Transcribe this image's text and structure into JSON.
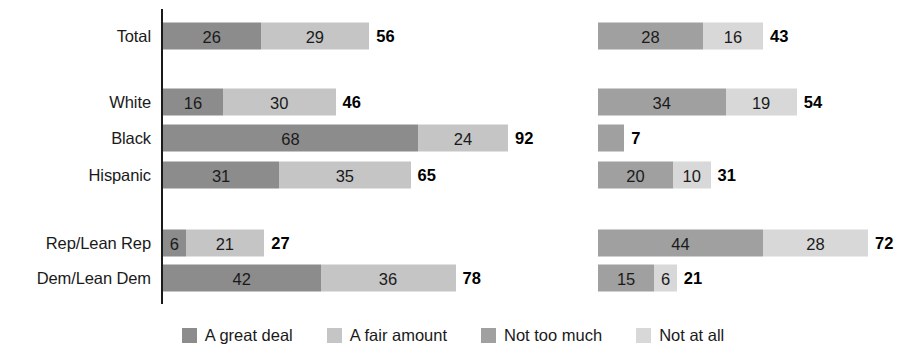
{
  "chart_data": {
    "type": "bar",
    "subtype": "stacked-horizontal-two-panel",
    "title": "",
    "xlabel": "",
    "ylabel": "",
    "grid": false,
    "axis_line": true,
    "units": "percent",
    "scale_px_per_unit": 3.75,
    "categories": [
      "Total",
      "White",
      "Black",
      "Hispanic",
      "Rep/Lean Rep",
      "Dem/Lean Dem"
    ],
    "legend": {
      "position": "bottom-center",
      "entries": [
        {
          "label": "A great deal",
          "color": "#8c8c8c"
        },
        {
          "label": "A fair amount",
          "color": "#c5c5c5"
        },
        {
          "label": "Not too much",
          "color": "#a0a0a0"
        },
        {
          "label": "Not at all",
          "color": "#d8d8d8"
        }
      ]
    },
    "panels": [
      {
        "name": "left",
        "series": [
          {
            "name": "A great deal",
            "color": "#8c8c8c",
            "values": [
              26,
              16,
              68,
              31,
              6,
              42
            ]
          },
          {
            "name": "A fair amount",
            "color": "#c5c5c5",
            "values": [
              29,
              30,
              24,
              35,
              21,
              36
            ]
          }
        ],
        "totals": [
          56,
          46,
          92,
          65,
          27,
          78
        ]
      },
      {
        "name": "right",
        "series": [
          {
            "name": "Not too much",
            "color": "#a0a0a0",
            "values": [
              28,
              34,
              7,
              20,
              44,
              15
            ]
          },
          {
            "name": "Not at all",
            "color": "#d8d8d8",
            "values": [
              16,
              19,
              0,
              10,
              28,
              6
            ]
          }
        ],
        "totals": [
          43,
          54,
          7,
          31,
          72,
          21
        ]
      }
    ]
  },
  "rows": [
    {
      "label": "Total",
      "y": 36,
      "left": {
        "seg1": "26",
        "seg1_v": 26,
        "seg2": "29",
        "seg2_v": 29,
        "total": "56"
      },
      "right": {
        "seg1": "28",
        "seg1_v": 28,
        "seg2": "16",
        "seg2_v": 16,
        "total": "43"
      }
    },
    {
      "label": "White",
      "y": 102,
      "left": {
        "seg1": "16",
        "seg1_v": 16,
        "seg2": "30",
        "seg2_v": 30,
        "total": "46"
      },
      "right": {
        "seg1": "34",
        "seg1_v": 34,
        "seg2": "19",
        "seg2_v": 19,
        "total": "54"
      }
    },
    {
      "label": "Black",
      "y": 138,
      "left": {
        "seg1": "68",
        "seg1_v": 68,
        "seg2": "24",
        "seg2_v": 24,
        "total": "92"
      },
      "right": {
        "seg1": "",
        "seg1_v": 7,
        "seg2": "",
        "seg2_v": 0,
        "total": "7"
      }
    },
    {
      "label": "Hispanic",
      "y": 175,
      "left": {
        "seg1": "31",
        "seg1_v": 31,
        "seg2": "35",
        "seg2_v": 35,
        "total": "65"
      },
      "right": {
        "seg1": "20",
        "seg1_v": 20,
        "seg2": "10",
        "seg2_v": 10,
        "total": "31"
      }
    },
    {
      "label": "Rep/Lean Rep",
      "y": 243,
      "left": {
        "seg1": "6",
        "seg1_v": 6,
        "seg2": "21",
        "seg2_v": 21,
        "total": "27"
      },
      "right": {
        "seg1": "44",
        "seg1_v": 44,
        "seg2": "28",
        "seg2_v": 28,
        "total": "72"
      }
    },
    {
      "label": "Dem/Lean Dem",
      "y": 278,
      "left": {
        "seg1": "42",
        "seg1_v": 42,
        "seg2": "36",
        "seg2_v": 36,
        "total": "78"
      },
      "right": {
        "seg1": "15",
        "seg1_v": 15,
        "seg2": "6",
        "seg2_v": 6,
        "total": "21"
      }
    }
  ],
  "colors": {
    "great_deal": "#8c8c8c",
    "fair_amount": "#c5c5c5",
    "not_too_much": "#a0a0a0",
    "not_at_all": "#d8d8d8",
    "axis": "#1a1a1a",
    "text": "#1a1a1a",
    "background": "#ffffff"
  },
  "geometry": {
    "left_origin_x": 163,
    "right_origin_x": 598,
    "px_per_unit": 3.75,
    "bar_height": 27
  }
}
